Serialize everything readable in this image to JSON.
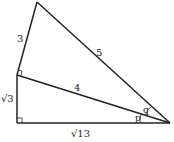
{
  "diagram": {
    "sides": {
      "top_left": "3",
      "hypotenuse_outer": "5",
      "hypotenuse_inner": "4",
      "left_vertical": "√3",
      "bottom": "√13"
    },
    "angles": {
      "upper": "q",
      "lower": "p"
    },
    "colors": {
      "stroke": "#222222",
      "background": "#ffffff"
    }
  }
}
